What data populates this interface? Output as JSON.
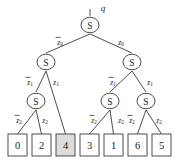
{
  "figure": {
    "kind": "binary-decision-tree",
    "root_label": "q",
    "node_symbol": "S",
    "colors": {
      "stroke": "#3a3a3a",
      "text": "#1a1a1a",
      "leaf_fill": "#ffffff",
      "leaf_highlight_fill": "#dcdcdc",
      "background": "#ffffff"
    }
  },
  "nodes": {
    "root": {
      "name": "root",
      "symbol": "S",
      "cx": 90,
      "cy": 25
    },
    "l1_left": {
      "name": "left-child",
      "symbol": "S",
      "cx": 46,
      "cy": 62
    },
    "l1_right": {
      "name": "right-child",
      "symbol": "S",
      "cx": 132,
      "cy": 62
    },
    "l2_a": {
      "name": "left-left-child",
      "symbol": "S",
      "cx": 36,
      "cy": 101
    },
    "l2_b": {
      "name": "right-left-child",
      "symbol": "S",
      "cx": 110,
      "cy": 101
    },
    "l2_c": {
      "name": "right-right-child",
      "symbol": "S",
      "cx": 146,
      "cy": 101
    }
  },
  "edge_labels": {
    "level0_false": {
      "base": "z",
      "sub": "0",
      "overbar": true,
      "x": 60,
      "y": 42
    },
    "level0_true": {
      "base": "z",
      "sub": "0",
      "overbar": false,
      "x": 121,
      "y": 42
    },
    "level1_left_false": {
      "base": "z",
      "sub": "1",
      "overbar": true,
      "x": 30,
      "y": 82
    },
    "level1_left_true": {
      "base": "z",
      "sub": "1",
      "overbar": false,
      "x": 56,
      "y": 82
    },
    "level1_right_false": {
      "base": "z",
      "sub": "1",
      "overbar": true,
      "x": 113,
      "y": 82
    },
    "level1_right_true": {
      "base": "z",
      "sub": "1",
      "overbar": false,
      "x": 150,
      "y": 82
    },
    "level2_a_false": {
      "base": "z",
      "sub": "2",
      "overbar": true,
      "x": 19,
      "y": 120
    },
    "level2_a_true": {
      "base": "z",
      "sub": "2",
      "overbar": false,
      "x": 45,
      "y": 120
    },
    "level2_b_false": {
      "base": "z",
      "sub": "2",
      "overbar": true,
      "x": 94,
      "y": 120
    },
    "level2_b_true": {
      "base": "z",
      "sub": "2",
      "overbar": false,
      "x": 121,
      "y": 120
    },
    "level2_c_false": {
      "base": "z",
      "sub": "2",
      "overbar": true,
      "x": 132,
      "y": 120
    },
    "level2_c_true": {
      "base": "z",
      "sub": "2",
      "overbar": false,
      "x": 159,
      "y": 120
    }
  },
  "leaves": [
    {
      "value": "0",
      "x": 8,
      "highlighted": false
    },
    {
      "value": "2",
      "x": 32,
      "highlighted": false
    },
    {
      "value": "4",
      "x": 56,
      "highlighted": true
    },
    {
      "value": "3",
      "x": 80,
      "highlighted": false
    },
    {
      "value": "1",
      "x": 104,
      "highlighted": false
    },
    {
      "value": "6",
      "x": 128,
      "highlighted": false
    },
    {
      "value": "5",
      "x": 152,
      "highlighted": false
    }
  ],
  "leaf_geometry": {
    "width": 19,
    "height": 22,
    "top": 134
  }
}
